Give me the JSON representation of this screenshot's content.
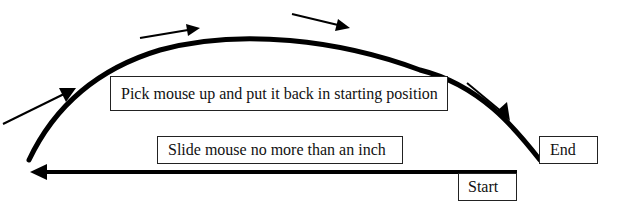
{
  "diagram": {
    "type": "process-illustration",
    "labels": {
      "pick_up": "Pick mouse up and put it back in starting position",
      "slide": "Slide mouse no more than an inch",
      "end": "End",
      "start": "Start"
    },
    "flow": [
      "start",
      "slide",
      "end",
      "pick_up",
      "start"
    ],
    "colors": {
      "stroke": "#000000",
      "box_border": "#222222",
      "background": "#ffffff"
    }
  }
}
